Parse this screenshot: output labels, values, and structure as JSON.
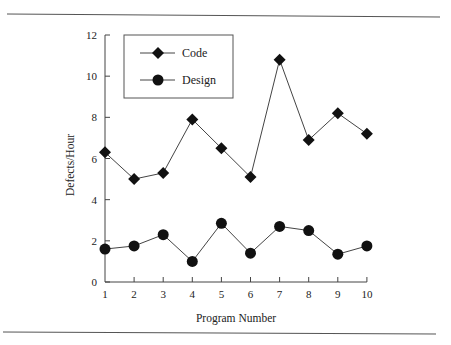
{
  "chart_data": {
    "type": "line",
    "title": "",
    "xlabel": "Program Number",
    "ylabel": "Defects/Hour",
    "x": [
      1,
      2,
      3,
      4,
      5,
      6,
      7,
      8,
      9,
      10
    ],
    "x_tick_labels": [
      "1",
      "2",
      "3",
      "4",
      "5",
      "6",
      "7",
      "8",
      "9",
      "10"
    ],
    "y_ticks": [
      0,
      2,
      4,
      6,
      8,
      10,
      12
    ],
    "y_tick_labels": [
      "0",
      "2",
      "4",
      "6",
      "8",
      "10",
      "12"
    ],
    "xlim": [
      1,
      10
    ],
    "ylim": [
      0,
      12
    ],
    "grid": false,
    "legend_position": "upper left (inside, boxed)",
    "series": [
      {
        "name": "Code",
        "marker": "diamond",
        "values": [
          6.3,
          5.0,
          5.3,
          7.9,
          6.5,
          5.1,
          10.8,
          6.9,
          8.2,
          7.2
        ]
      },
      {
        "name": "Design",
        "marker": "circle",
        "values": [
          1.6,
          1.75,
          2.3,
          1.0,
          2.85,
          1.4,
          2.7,
          2.5,
          1.35,
          1.75
        ]
      }
    ]
  },
  "legend": {
    "items": [
      {
        "label": "Code",
        "marker": "diamond"
      },
      {
        "label": "Design",
        "marker": "circle"
      }
    ]
  },
  "colors": {
    "ink": "#111111",
    "line": "#444444",
    "rule": "#555555"
  }
}
